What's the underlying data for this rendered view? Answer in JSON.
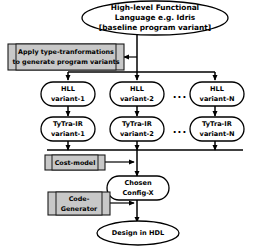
{
  "diagram": {
    "title_node": {
      "id": "hll-source",
      "lines": [
        "High-level Functional",
        "Language e.g. Idris",
        "[baseline program variant]"
      ]
    },
    "transform_box": {
      "id": "apply-type-transformations",
      "lines": [
        "Apply type-tranformations",
        "to generate program variants"
      ],
      "fill_color": "#c8c8c8"
    },
    "hll_variants": [
      {
        "line1": "HLL",
        "line2": "variant-1"
      },
      {
        "line1": "HLL",
        "line2": "variant-2"
      },
      {
        "line1": "HLL",
        "line2": "variant-N"
      }
    ],
    "ir_variants": [
      {
        "line1": "TyTra-IR",
        "line2": "variant-1"
      },
      {
        "line1": "TyTra-IR",
        "line2": "variant-2"
      },
      {
        "line1": "TyTra-IR",
        "line2": "variant-N"
      }
    ],
    "ellipsis": "...",
    "cost_model_box": {
      "id": "cost-model",
      "lines": [
        "Cost-model"
      ],
      "fill_color": "#c8c8c8"
    },
    "chosen_config": {
      "id": "chosen-config",
      "lines": [
        "Chosen",
        "Config-X"
      ]
    },
    "code_generator_box": {
      "id": "code-generator",
      "lines": [
        "Code-",
        "Generator"
      ],
      "fill_color": "#c8c8c8"
    },
    "design_output": {
      "id": "design-in-hdl",
      "lines": [
        "Design in HDL"
      ]
    },
    "colors": {
      "background": "#ffffff",
      "stroke": "#000000",
      "process_fill": "#c8c8c8"
    }
  }
}
